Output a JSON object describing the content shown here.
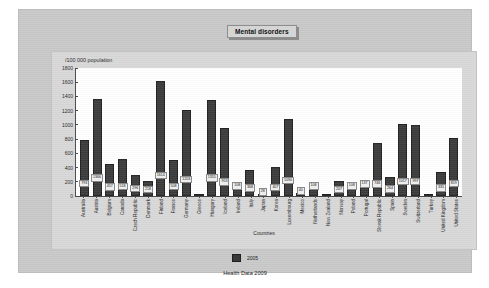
{
  "window": {
    "title": "Mental disorders"
  },
  "chart_data": {
    "type": "bar",
    "title": "Mental disorders",
    "xlabel": "Countries",
    "ylabel": "/100 000 population",
    "ylim": [
      0,
      1800
    ],
    "yticks": [
      1800,
      1600,
      1400,
      1200,
      1000,
      800,
      600,
      400,
      200,
      0
    ],
    "grid": false,
    "legend_position": "bottom",
    "series": [
      {
        "name": "2005",
        "color": "#3b3b3b",
        "values": [
          793,
          1366,
          457,
          518,
          296,
          218,
          1614,
          508,
          1203,
          0,
          1355,
          953,
          108,
          368,
          28,
          407,
          1090,
          40,
          108,
          0,
          207,
          108,
          137,
          746,
          264,
          1017,
          997,
          0,
          335,
          819
        ]
      }
    ],
    "categories": [
      "Australia",
      "Austria",
      "Belgium",
      "Canada",
      "Czech Republic",
      "Denmark",
      "Finland",
      "France",
      "Germany",
      "Greece",
      "Hungary",
      "Iceland",
      "Ireland",
      "Italy",
      "Japan",
      "Korea",
      "Luxembourg",
      "Mexico",
      "Netherlands",
      "New Zealand",
      "Norway",
      "Poland",
      "Portugal",
      "Slovak Republic",
      "Spain",
      "Sweden",
      "Switzerland",
      "Turkey",
      "United Kingdom",
      "United States"
    ],
    "data_labels": [
      "793",
      "1366",
      "457",
      "518",
      "296",
      "218",
      "1614",
      "508",
      "1203",
      "",
      "1355",
      "953",
      "108",
      "368",
      "28",
      "407",
      "1090",
      "40",
      "108",
      "",
      "207",
      "108",
      "137",
      "746",
      "264",
      "1017",
      "997",
      "",
      "335",
      "819"
    ],
    "source": "Health Data 2009"
  },
  "legend": {
    "entries": [
      {
        "label": "2005",
        "color": "#3b3b3b"
      }
    ]
  },
  "footer": {
    "text": "Health Data 2009"
  }
}
